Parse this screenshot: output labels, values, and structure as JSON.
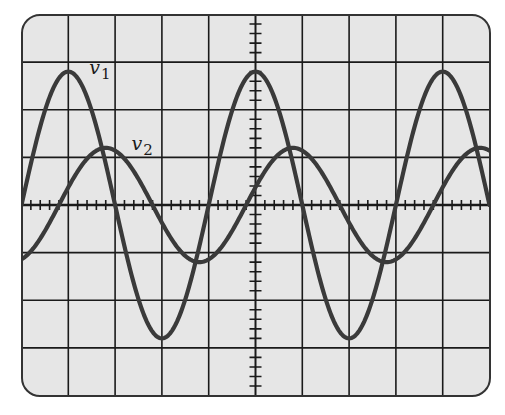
{
  "chart_data": {
    "type": "line",
    "title": "",
    "xlabel": "",
    "ylabel": "",
    "grid": {
      "on": true,
      "x_divisions": 10,
      "y_divisions": 8,
      "minor_ticks_per_division": 5,
      "center_axes_ticked": true
    },
    "xlim": [
      -5,
      5
    ],
    "ylim": [
      -4,
      4
    ],
    "units": "divisions",
    "series": [
      {
        "name": "v1",
        "label": "v",
        "subscript": "1",
        "amplitude_div": 2.8,
        "period_div": 4,
        "phase_peak_at_div": 0,
        "peaks_x_div": [
          -4,
          0,
          4
        ],
        "troughs_x_div": [
          -2,
          2
        ],
        "label_pos_div": [
          -3.55,
          2.75
        ]
      },
      {
        "name": "v2",
        "label": "v",
        "subscript": "2",
        "amplitude_div": 1.2,
        "period_div": 4,
        "phase_peak_at_div": 0.8,
        "peaks_x_div": [
          -3.2,
          0.8,
          4.8
        ],
        "troughs_x_div": [
          -1.2,
          2.8
        ],
        "label_pos_div": [
          -2.65,
          1.15
        ]
      }
    ],
    "legend": "none (inline labels v1, v2)"
  },
  "colors": {
    "screen_background": "#e6e6e6",
    "grid": "#1a1a1a",
    "trace": "#3a3a3a",
    "border": "#333333"
  },
  "labels": {
    "v1_main": "v",
    "v1_sub": "1",
    "v2_main": "v",
    "v2_sub": "2"
  }
}
